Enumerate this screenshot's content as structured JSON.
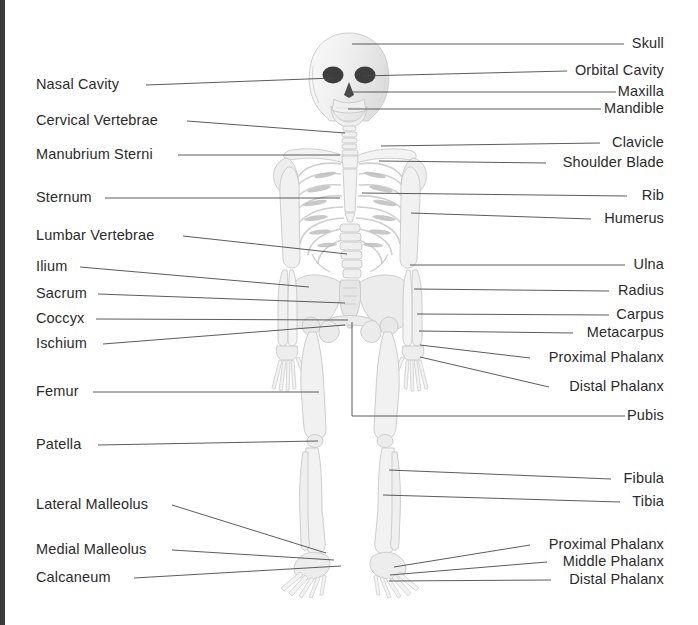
{
  "diagram": {
    "background_color": "#ffffff",
    "edge_strip_color": "#3b3b3b",
    "label_color": "#2b2b2b",
    "leader_line_color": "#4a4a4a",
    "bone_fill": "#f4f4f4",
    "bone_outline": "#c9c9c9",
    "bone_shade": "#e2e2e2",
    "eye_socket_color": "#3a3a3a"
  },
  "labels_left": [
    {
      "id": "nasal-cavity",
      "text": "Nasal Cavity",
      "x": 36,
      "y": 85,
      "line_start_x": 146,
      "line_end_x": 334,
      "line_end_y": 78
    },
    {
      "id": "cervical-vertebrae",
      "text": "Cervical Vertebrae",
      "x": 36,
      "y": 121,
      "line_start_x": 187,
      "line_end_x": 345,
      "line_end_y": 133
    },
    {
      "id": "manubrium-sterni",
      "text": "Manubrium Sterni",
      "x": 36,
      "y": 155,
      "line_start_x": 178,
      "line_end_x": 340,
      "line_end_y": 155
    },
    {
      "id": "sternum",
      "text": "Sternum",
      "x": 36,
      "y": 198,
      "line_start_x": 105,
      "line_end_x": 340,
      "line_end_y": 198
    },
    {
      "id": "lumbar-vertebrae",
      "text": "Lumbar Vertebrae",
      "x": 36,
      "y": 236,
      "line_start_x": 183,
      "line_end_x": 347,
      "line_end_y": 254
    },
    {
      "id": "ilium",
      "text": "Ilium",
      "x": 36,
      "y": 267,
      "line_start_x": 80,
      "line_end_x": 309,
      "line_end_y": 287
    },
    {
      "id": "sacrum",
      "text": "Sacrum",
      "x": 36,
      "y": 294,
      "line_start_x": 98,
      "line_end_x": 345,
      "line_end_y": 303
    },
    {
      "id": "coccyx",
      "text": "Coccyx",
      "x": 36,
      "y": 319,
      "line_start_x": 96,
      "line_end_x": 348,
      "line_end_y": 320
    },
    {
      "id": "ischium",
      "text": "Ischium",
      "x": 36,
      "y": 344,
      "line_start_x": 103,
      "line_end_x": 345,
      "line_end_y": 325
    },
    {
      "id": "femur",
      "text": "Femur",
      "x": 36,
      "y": 392,
      "line_start_x": 93,
      "line_end_x": 319,
      "line_end_y": 392
    },
    {
      "id": "patella",
      "text": "Patella",
      "x": 36,
      "y": 445,
      "line_start_x": 98,
      "line_end_x": 318,
      "line_end_y": 441
    },
    {
      "id": "lateral-malleolus",
      "text": "Lateral Malleolus",
      "x": 36,
      "y": 505,
      "line_start_x": 172,
      "line_end_x": 326,
      "line_end_y": 553
    },
    {
      "id": "medial-malleolus",
      "text": "Medial Malleolus",
      "x": 36,
      "y": 550,
      "line_start_x": 172,
      "line_end_x": 334,
      "line_end_y": 560
    },
    {
      "id": "calcaneum",
      "text": "Calcaneum",
      "x": 36,
      "y": 578,
      "line_start_x": 134,
      "line_end_x": 341,
      "line_end_y": 566
    }
  ],
  "labels_right": [
    {
      "id": "skull",
      "text": "Skull",
      "x": 664,
      "y": 44,
      "line_start_x": 624,
      "line_end_x": 352,
      "line_end_y": 44
    },
    {
      "id": "orbital-cavity",
      "text": "Orbital Cavity",
      "x": 664,
      "y": 71,
      "line_start_x": 567,
      "line_end_x": 362,
      "line_end_y": 76
    },
    {
      "id": "maxilla",
      "text": "Maxilla",
      "x": 664,
      "y": 92,
      "line_start_x": 616,
      "line_end_x": 350,
      "line_end_y": 92
    },
    {
      "id": "mandible",
      "text": "Mandible",
      "x": 664,
      "y": 109,
      "line_start_x": 601,
      "line_end_x": 348,
      "line_end_y": 109
    },
    {
      "id": "clavicle",
      "text": "Clavicle",
      "x": 664,
      "y": 143,
      "line_start_x": 600,
      "line_end_x": 381,
      "line_end_y": 146
    },
    {
      "id": "shoulder-blade",
      "text": "Shoulder Blade",
      "x": 664,
      "y": 163,
      "line_start_x": 546,
      "line_end_x": 379,
      "line_end_y": 161
    },
    {
      "id": "rib",
      "text": "Rib",
      "x": 664,
      "y": 196,
      "line_start_x": 627,
      "line_end_x": 362,
      "line_end_y": 193
    },
    {
      "id": "humerus",
      "text": "Humerus",
      "x": 664,
      "y": 219,
      "line_start_x": 591,
      "line_end_x": 411,
      "line_end_y": 213
    },
    {
      "id": "ulna",
      "text": "Ulna",
      "x": 664,
      "y": 265,
      "line_start_x": 625,
      "line_end_x": 410,
      "line_end_y": 265
    },
    {
      "id": "radius",
      "text": "Radius",
      "x": 664,
      "y": 291,
      "line_start_x": 609,
      "line_end_x": 414,
      "line_end_y": 289
    },
    {
      "id": "carpus",
      "text": "Carpus",
      "x": 664,
      "y": 315,
      "line_start_x": 609,
      "line_end_x": 417,
      "line_end_y": 314
    },
    {
      "id": "metacarpus",
      "text": "Metacarpus",
      "x": 664,
      "y": 333,
      "line_start_x": 573,
      "line_end_x": 419,
      "line_end_y": 331
    },
    {
      "id": "proximal-phalanx",
      "text": "Proximal Phalanx",
      "x": 664,
      "y": 358,
      "line_start_x": 530,
      "line_end_x": 420,
      "line_end_y": 345
    },
    {
      "id": "distal-phalanx",
      "text": "Distal Phalanx",
      "x": 664,
      "y": 387,
      "line_start_x": 549,
      "line_end_x": 420,
      "line_end_y": 357
    },
    {
      "id": "pubis",
      "text": "Pubis",
      "x": 664,
      "y": 416,
      "line_start_x": 625,
      "line_end_x": 352,
      "line_end_y": 416
    },
    {
      "id": "fibula",
      "text": "Fibula",
      "x": 664,
      "y": 479,
      "line_start_x": 611,
      "line_end_x": 389,
      "line_end_y": 470
    },
    {
      "id": "tibia",
      "text": "Tibia",
      "x": 664,
      "y": 502,
      "line_start_x": 620,
      "line_end_x": 383,
      "line_end_y": 495
    },
    {
      "id": "proximal-phalanx-foot",
      "text": "Proximal Phalanx",
      "x": 664,
      "y": 545,
      "line_start_x": 530,
      "line_end_x": 394,
      "line_end_y": 567
    },
    {
      "id": "middle-phalanx-foot",
      "text": "Middle Phalanx",
      "x": 664,
      "y": 562,
      "line_start_x": 547,
      "line_end_x": 390,
      "line_end_y": 575
    },
    {
      "id": "distal-phalanx-foot",
      "text": "Distal Phalanx",
      "x": 664,
      "y": 580,
      "line_start_x": 551,
      "line_end_x": 389,
      "line_end_y": 581
    }
  ],
  "pubis_leader": {
    "horizontal_y": 416,
    "corner_x": 352,
    "vertical_top_y": 322
  }
}
